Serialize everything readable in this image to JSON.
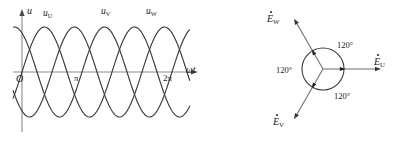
{
  "figure": {
    "stroke_color": "#3a3a3a",
    "text_color": "#1a1a1a",
    "background": "#ffffff"
  },
  "waveform_panel": {
    "y_axis_label": "u",
    "x_axis_label": "ωt",
    "origin_label": "O",
    "x_ticks": [
      {
        "label": "π",
        "x_px": 78
      },
      {
        "label": "2π",
        "x_px": 168
      }
    ],
    "curve_labels": [
      {
        "name": "u-U",
        "base": "u",
        "sub": "U",
        "x_px": 44,
        "y_px": 10
      },
      {
        "name": "u-V",
        "base": "u",
        "sub": "V",
        "x_px": 102,
        "y_px": 8
      },
      {
        "name": "u-W",
        "base": "u",
        "sub": "W",
        "x_px": 147,
        "y_px": 8
      }
    ],
    "axes": {
      "origin_x_px": 22,
      "axis_y_px": 72,
      "x_end_px": 196,
      "y_top_px": 12,
      "y_bottom_px": 132,
      "amplitude_px": 45,
      "period_px": 90
    }
  },
  "chart_data": {
    "type": "line",
    "xlabel": "ωt",
    "ylabel": "u",
    "x_tick_labels": [
      "O",
      "π",
      "2π"
    ],
    "x_tick_values": [
      0,
      3.14159,
      6.28319
    ],
    "xlim": [
      -0.5,
      7.6
    ],
    "ylim": [
      -1.25,
      1.25
    ],
    "grid": false,
    "legend": "inline-curve-labels",
    "series": [
      {
        "name": "u_U",
        "phase_deg": 0,
        "amplitude": 1,
        "label": "uU"
      },
      {
        "name": "u_V",
        "phase_deg": -120,
        "amplitude": 1,
        "label": "uV"
      },
      {
        "name": "u_W",
        "phase_deg": -240,
        "amplitude": 1,
        "label": "uW"
      }
    ]
  },
  "phasor_panel": {
    "center_x_px": 323,
    "center_y_px": 69,
    "circle_radius_px": 21,
    "arrow_length_px": 58,
    "phasors": [
      {
        "name": "E-U",
        "base": "E",
        "sub": "U",
        "angle_deg": 0,
        "label_x_px": 374,
        "label_y_px": 57
      },
      {
        "name": "E-W",
        "base": "E",
        "sub": "W",
        "angle_deg": 120,
        "label_x_px": 267,
        "label_y_px": 14
      },
      {
        "name": "E-V",
        "base": "E",
        "sub": "V",
        "angle_deg": 240,
        "label_x_px": 273,
        "label_y_px": 117
      }
    ],
    "angle_labels": [
      {
        "name": "angle-top-right",
        "text": "120°",
        "x_px": 337,
        "y_px": 41
      },
      {
        "name": "angle-left",
        "text": "120°",
        "x_px": 276,
        "y_px": 66
      },
      {
        "name": "angle-bottom",
        "text": "120°",
        "x_px": 334,
        "y_px": 92
      }
    ]
  }
}
